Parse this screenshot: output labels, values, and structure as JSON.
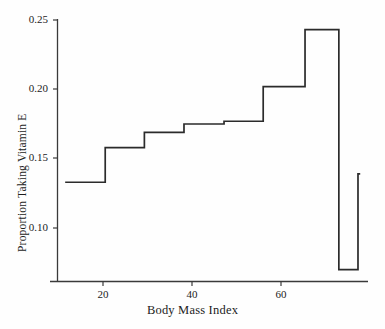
{
  "chart_data": {
    "type": "line",
    "title": "",
    "subtitle": "",
    "xlabel": "Body Mass Index",
    "ylabel": "Proportion Taking Vitamin E",
    "xlim": [
      11.5,
      77.8
    ],
    "ylim": [
      0.066,
      0.252
    ],
    "grid": false,
    "legend": null,
    "style": "step-function / empirical proportion by BMI bin",
    "xticks": [
      20,
      40,
      60
    ],
    "xtick_labels": [
      "20",
      "40",
      "60"
    ],
    "yticks": [
      0.1,
      0.15,
      0.2,
      0.25
    ],
    "ytick_labels": [
      "0.10",
      "0.15",
      "0.20",
      "0.25"
    ],
    "series": [
      {
        "name": "Proportion Taking Vitamin E",
        "color": "#2b2b2b",
        "step_bins": [
          {
            "x_start": 11.5,
            "x_end": 20.5,
            "value": 0.133
          },
          {
            "x_start": 20.5,
            "x_end": 29.3,
            "value": 0.158
          },
          {
            "x_start": 29.3,
            "x_end": 38.2,
            "value": 0.169
          },
          {
            "x_start": 38.2,
            "x_end": 47.2,
            "value": 0.175
          },
          {
            "x_start": 47.2,
            "x_end": 56.0,
            "value": 0.177
          },
          {
            "x_start": 56.0,
            "x_end": 65.4,
            "value": 0.202
          },
          {
            "x_start": 65.4,
            "x_end": 73.0,
            "value": 0.243
          },
          {
            "x_start": 73.0,
            "x_end": 77.3,
            "value": 0.07
          },
          {
            "x_start": 77.3,
            "x_end": 77.8,
            "value": 0.139
          }
        ],
        "x": [
          11.5,
          20.5,
          20.5,
          29.3,
          29.3,
          38.2,
          38.2,
          47.2,
          47.2,
          56.0,
          56.0,
          65.4,
          65.4,
          73.0,
          73.0,
          77.3,
          77.3,
          77.8
        ],
        "y": [
          0.133,
          0.133,
          0.158,
          0.158,
          0.169,
          0.169,
          0.175,
          0.175,
          0.177,
          0.177,
          0.202,
          0.202,
          0.243,
          0.243,
          0.07,
          0.07,
          0.139,
          0.139
        ]
      }
    ]
  },
  "axes": {
    "x_title": "Body Mass Index",
    "y_title": "Proportion Taking Vitamin E",
    "x_tick_labels": [
      "20",
      "40",
      "60"
    ],
    "y_tick_labels": [
      "0.25",
      "0.20",
      "0.15",
      "0.10"
    ]
  },
  "colors": {
    "line": "#2b2b2b",
    "axis": "#3a3a3a",
    "background": "#fefefe",
    "text": "#1c1c1c"
  }
}
